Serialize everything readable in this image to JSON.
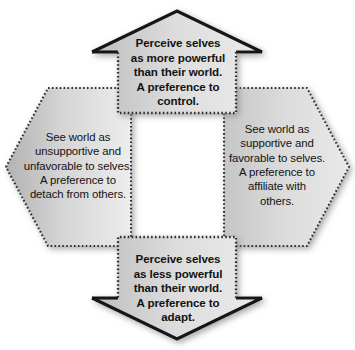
{
  "figure": {
    "type": "cycle-diagram",
    "shape_layout": "octagonal ring of four shapes around an empty white centre",
    "fill_gradient_from": "#b5b5b5",
    "fill_gradient_to": "#ececec",
    "outline_solid_color": "#1a1a1a",
    "outline_dotted_color": "#2b2b2b",
    "background": "#ffffff"
  },
  "nodes": {
    "top": {
      "shape": "up-arrow",
      "text_weight": "bold",
      "lines": [
        "Perceive selves",
        "as more powerful",
        "than their world.",
        "A preference to",
        "control."
      ]
    },
    "bottom": {
      "shape": "down-arrow",
      "text_weight": "bold",
      "lines": [
        "Perceive selves",
        "as less powerful",
        "than their world.",
        "A preference to",
        "adapt."
      ]
    },
    "left": {
      "shape": "left-hexagon-wing",
      "text_weight": "normal",
      "lines": [
        "See world as",
        "unsupportive and",
        "unfavorable to selves.",
        "A preference to",
        "detach from others."
      ]
    },
    "right": {
      "shape": "right-hexagon-wing",
      "text_weight": "normal",
      "lines": [
        "See world as",
        "supportive and",
        "favorable to selves.",
        "A preference to",
        "affiliate with",
        "others."
      ]
    }
  }
}
